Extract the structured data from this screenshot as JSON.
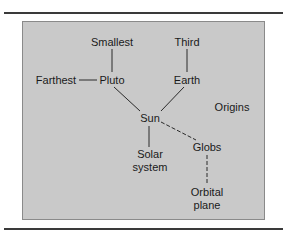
{
  "diagram": {
    "type": "concept-map",
    "colors": {
      "panel": "#c9c9c9",
      "panel_border": "#8a8a8a",
      "text": "#1a1a1a",
      "rule": "#3a3a3a"
    },
    "nodes": {
      "smallest": "Smallest",
      "third": "Third",
      "farthest": "Farthest",
      "pluto": "Pluto",
      "earth": "Earth",
      "origins": "Origins",
      "sun": "Sun",
      "solar_line1": "Solar",
      "solar_line2": "system",
      "globs": "Globs",
      "orbital_line1": "Orbital",
      "orbital_line2": "plane"
    },
    "edges": [
      {
        "from": "Smallest",
        "to": "Pluto",
        "style": "solid"
      },
      {
        "from": "Farthest",
        "to": "Pluto",
        "style": "solid"
      },
      {
        "from": "Third",
        "to": "Earth",
        "style": "solid"
      },
      {
        "from": "Pluto",
        "to": "Sun",
        "style": "solid"
      },
      {
        "from": "Earth",
        "to": "Sun",
        "style": "solid"
      },
      {
        "from": "Sun",
        "to": "Solar system",
        "style": "solid"
      },
      {
        "from": "Sun",
        "to": "Globs",
        "style": "dashed"
      },
      {
        "from": "Globs",
        "to": "Orbital plane",
        "style": "dashed"
      }
    ]
  }
}
